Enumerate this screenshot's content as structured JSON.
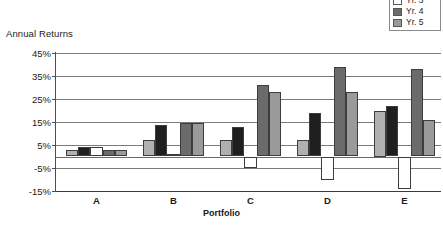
{
  "chart_data": {
    "type": "bar",
    "title": "",
    "ylabel": "Annual Returns",
    "xlabel": "Portfolio",
    "categories": [
      "A",
      "B",
      "C",
      "D",
      "E"
    ],
    "ylim": [
      -15,
      45
    ],
    "yticks": [
      45,
      35,
      25,
      15,
      5,
      -5,
      -15
    ],
    "ytick_labels": [
      "45%",
      "35%",
      "25%",
      "15%",
      "5%",
      "-5%",
      "-15%"
    ],
    "grid": true,
    "legend_position": "top-right",
    "legend_note": "Yr. 1 entry is cropped above the top edge of the image",
    "series": [
      {
        "name": "Yr. 1",
        "color": "#b0b0b0",
        "visible_in_legend": false,
        "values": [
          3,
          7,
          7,
          7,
          20
        ]
      },
      {
        "name": "Yr. 2",
        "color": "#1f1f1f",
        "visible_in_legend": true,
        "values": [
          4,
          13.5,
          13,
          19,
          22
        ]
      },
      {
        "name": "Yr. 3",
        "color": "#ffffff",
        "visible_in_legend": true,
        "values": [
          4,
          1,
          -5,
          -10,
          -14
        ]
      },
      {
        "name": "Yr. 4",
        "color": "#6b6b6b",
        "visible_in_legend": true,
        "values": [
          3,
          14.5,
          31,
          39,
          38
        ]
      },
      {
        "name": "Yr. 5",
        "color": "#9a9a9a",
        "visible_in_legend": true,
        "values": [
          3,
          14.5,
          28,
          28,
          16
        ]
      }
    ]
  },
  "legend": {
    "items": [
      {
        "label": "Yr. 2",
        "color": "#1f1f1f"
      },
      {
        "label": "Yr. 3",
        "color": "#ffffff"
      },
      {
        "label": "Yr. 4",
        "color": "#6b6b6b"
      },
      {
        "label": "Yr. 5",
        "color": "#9a9a9a"
      }
    ]
  }
}
